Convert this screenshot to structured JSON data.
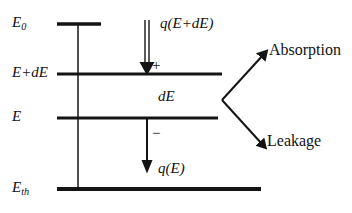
{
  "diagram": {
    "stroke_color": "#141414",
    "background": "#ffffff",
    "levels": [
      {
        "id": "E0",
        "label_main": "E",
        "label_sub": "0",
        "y": 24,
        "bar_x1": 57,
        "bar_x2": 101,
        "thickness": 3.4
      },
      {
        "id": "EpdE",
        "label_main": "E+dE",
        "label_sub": "",
        "y": 74,
        "bar_x1": 57,
        "bar_x2": 222,
        "thickness": 3.0
      },
      {
        "id": "E",
        "label_main": "E",
        "label_sub": "",
        "y": 118,
        "bar_x1": 57,
        "bar_x2": 218,
        "thickness": 3.0
      },
      {
        "id": "Eth",
        "label_main": "E",
        "label_sub": "th",
        "y": 189,
        "bar_x1": 57,
        "bar_x2": 261,
        "thickness": 3.6
      }
    ],
    "axis": {
      "x": 78,
      "y1": 24,
      "y2": 189,
      "thickness": 1.4
    },
    "arrows": {
      "influx": {
        "name": "q(E+dE)",
        "label_prefix": "q(",
        "label_body": "E+dE",
        "label_suffix": ")",
        "sign": "+",
        "style": "double-stem",
        "x": 147,
        "y_start": 20,
        "y_end": 74
      },
      "outflux": {
        "name": "q(E)",
        "label_prefix": "q(",
        "label_body": "E",
        "label_suffix": ")",
        "sign": "−",
        "style": "single-stem",
        "x": 147,
        "y_start": 118,
        "y_end": 172
      }
    },
    "interval_label": {
      "text": "dE",
      "x": 160,
      "y": 98
    },
    "branch": {
      "vertex_x": 222,
      "vertex_y": 100,
      "branches": [
        {
          "label": "Absorption",
          "tip_x": 266,
          "tip_y": 52,
          "text_x": 271,
          "text_y": 46
        },
        {
          "label": "Leakage",
          "tip_x": 264,
          "tip_y": 146,
          "text_x": 269,
          "text_y": 140
        }
      ]
    }
  }
}
